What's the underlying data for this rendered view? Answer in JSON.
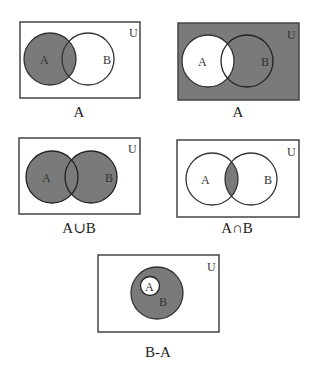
{
  "colors": {
    "shade": "#7a7a7a",
    "background": "#ffffff",
    "stroke": "#333333"
  },
  "panels": [
    {
      "id": "a-shaded",
      "universe_label": "U",
      "set_a_label": "A",
      "set_b_label": "B",
      "shaded_region": "A",
      "caption": "A"
    },
    {
      "id": "a-complement",
      "universe_label": "U",
      "set_a_label": "A",
      "set_b_label": "B",
      "shaded_region": "U minus A",
      "caption": "A"
    },
    {
      "id": "union",
      "universe_label": "U",
      "set_a_label": "A",
      "set_b_label": "B",
      "shaded_region": "A union B",
      "caption": "A∪B"
    },
    {
      "id": "intersection",
      "universe_label": "U",
      "set_a_label": "A",
      "set_b_label": "B",
      "shaded_region": "A intersect B",
      "caption": "A∩B"
    },
    {
      "id": "difference",
      "universe_label": "U",
      "set_a_label": "A",
      "set_b_label": "B",
      "shaded_region": "B minus A (A subset of B)",
      "caption": "B-A"
    }
  ]
}
